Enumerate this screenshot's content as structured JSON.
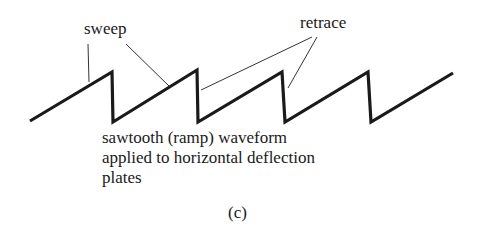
{
  "figure": {
    "labels": {
      "sweep": "sweep",
      "retrace": "retrace"
    },
    "caption_lines": [
      "sawtooth (ramp) waveform",
      "applied to horizontal deflection",
      "plates"
    ],
    "figure_label": "(c)",
    "waveform": {
      "type": "sawtooth",
      "points": [
        [
          30,
          121
        ],
        [
          112,
          72
        ],
        [
          113,
          122
        ],
        [
          197,
          70
        ],
        [
          198,
          122
        ],
        [
          282,
          72
        ],
        [
          285,
          122
        ],
        [
          368,
          72
        ],
        [
          371,
          122
        ],
        [
          453,
          73
        ]
      ],
      "stroke": "#1a1a1a"
    },
    "leader_lines": {
      "sweep": [
        [
          [
            88,
            44
          ],
          [
            89,
            82
          ]
        ],
        [
          [
            126,
            44
          ],
          [
            170,
            87
          ]
        ]
      ],
      "retrace": [
        [
          [
            312,
            37
          ],
          [
            201,
            90
          ]
        ],
        [
          [
            317,
            37
          ],
          [
            288,
            88
          ]
        ]
      ]
    }
  }
}
